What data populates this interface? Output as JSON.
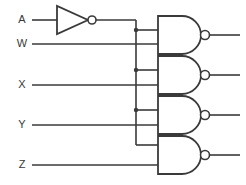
{
  "diagram": {
    "type": "logic-circuit-schematic",
    "colors": {
      "background": "#ffffff",
      "line": "#3a3a3a",
      "gate_fill": "#ffffff"
    },
    "canvas": {
      "width": 246,
      "height": 185
    }
  },
  "inputs": [
    {
      "id": "A",
      "label": "A",
      "label_x": 22,
      "label_y": 20,
      "wire_y": 20
    },
    {
      "id": "W",
      "label": "W",
      "label_x": 22,
      "label_y": 44,
      "wire_y": 44
    },
    {
      "id": "X",
      "label": "X",
      "label_x": 22,
      "label_y": 85,
      "wire_y": 85
    },
    {
      "id": "Y",
      "label": "Y",
      "label_x": 22,
      "label_y": 125,
      "wire_y": 125
    },
    {
      "id": "Z",
      "label": "Z",
      "label_x": 22,
      "label_y": 165,
      "wire_y": 165
    }
  ],
  "inverter": {
    "name": "not-gate-A",
    "input_signal": "A",
    "triangle": "57,6 57,34 88,20",
    "bubble": {
      "cx": 92,
      "cy": 20,
      "r": 4
    },
    "input_wire": "M32,20 L57,20",
    "output_wire": "M96,20 L136,20"
  },
  "bus": {
    "name": "inverted-a-bus",
    "signal": "A-bar",
    "x": 136,
    "path": "M136,20 L136,145",
    "junctions": [
      {
        "cx": 136,
        "cy": 30,
        "r": 2.2,
        "feeds": "nand-gate-1-input-top"
      },
      {
        "cx": 136,
        "cy": 70,
        "r": 2.2,
        "feeds": "nand-gate-2-input-top"
      },
      {
        "cx": 136,
        "cy": 110,
        "r": 2.2,
        "feeds": "nand-gate-3-input-top"
      }
    ],
    "stubs": [
      "M136,30 L158,30",
      "M136,70 L158,70",
      "M136,110 L158,110",
      "M136,145 L158,145"
    ]
  },
  "gates": [
    {
      "name": "nand-gate-1",
      "type": "NAND",
      "body": "M158,16 L182,16 A 19 19 0 0 1 182,54 L158,54 Z",
      "bubble": {
        "cx": 205,
        "cy": 35,
        "r": 4.5
      },
      "input_top": {
        "signal": "A-bar",
        "wire": "M136,30 L158,30",
        "y": 30
      },
      "input_bottom": {
        "signal": "W",
        "wire": "M32,44 L158,44",
        "y": 44
      },
      "output_wire": "M209.5,35 L240,35"
    },
    {
      "name": "nand-gate-2",
      "type": "NAND",
      "body": "M158,56 L182,56 A 19 19 0 0 1 182,94 L158,94 Z",
      "bubble": {
        "cx": 205,
        "cy": 75,
        "r": 4.5
      },
      "input_top": {
        "signal": "A-bar",
        "wire": "M136,70 L158,70",
        "y": 70
      },
      "input_bottom": {
        "signal": "X",
        "wire": "M32,85 L158,85",
        "y": 85
      },
      "output_wire": "M209.5,75 L240,75"
    },
    {
      "name": "nand-gate-3",
      "type": "NAND",
      "body": "M158,96 L182,96 A 19 19 0 0 1 182,134 L158,134 Z",
      "bubble": {
        "cx": 205,
        "cy": 115,
        "r": 4.5
      },
      "input_top": {
        "signal": "A-bar",
        "wire": "M136,110 L158,110",
        "y": 110
      },
      "input_bottom": {
        "signal": "Y",
        "wire": "M32,125 L158,125",
        "y": 125
      },
      "output_wire": "M209.5,115 L240,115"
    },
    {
      "name": "nand-gate-4",
      "type": "NAND",
      "body": "M158,136 L182,136 A 19 19 0 0 1 182,174 L158,174 Z",
      "bubble": {
        "cx": 205,
        "cy": 155,
        "r": 4.5
      },
      "input_top": {
        "signal": "A-bar",
        "wire": "M136,145 L158,145",
        "y": 145
      },
      "input_bottom": {
        "signal": "Z",
        "wire": "M32,165 L158,165",
        "y": 165
      },
      "output_wire": "M209.5,155 L240,155"
    }
  ]
}
